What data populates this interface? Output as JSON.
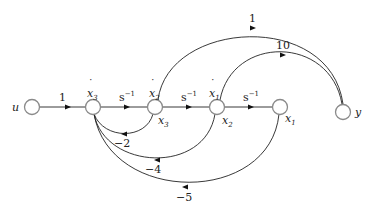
{
  "diagram": {
    "type": "signal-flow-graph",
    "nodes": [
      {
        "id": "u",
        "label": "u"
      },
      {
        "id": "x3dot",
        "label": "ẋ₃",
        "sub_label": "ẋ",
        "index": "3"
      },
      {
        "id": "x2dot",
        "label": "ẋ₂",
        "sub_label": "ẋ",
        "index": "2",
        "state_label": "x",
        "state_index": "3"
      },
      {
        "id": "x1dot",
        "label": "ẋ₁",
        "sub_label": "ẋ",
        "index": "1",
        "state_label": "x",
        "state_index": "2"
      },
      {
        "id": "x1",
        "label": "x₁",
        "state_label": "x",
        "state_index": "1"
      },
      {
        "id": "y",
        "label": "y"
      }
    ],
    "edges": [
      {
        "from": "u",
        "to": "x3dot",
        "gain": "1"
      },
      {
        "from": "x3dot",
        "to": "x2dot",
        "gain": "s",
        "gain_exp": "−1"
      },
      {
        "from": "x2dot",
        "to": "x1dot",
        "gain": "s",
        "gain_exp": "−1"
      },
      {
        "from": "x1dot",
        "to": "x1",
        "gain": "s",
        "gain_exp": "−1"
      },
      {
        "from": "x2dot",
        "to": "y",
        "gain": "1"
      },
      {
        "from": "x1dot",
        "to": "y",
        "gain": "10"
      },
      {
        "from": "x2dot",
        "to": "x3dot",
        "gain": "−2"
      },
      {
        "from": "x1dot",
        "to": "x3dot",
        "gain": "−4"
      },
      {
        "from": "x1",
        "to": "x3dot",
        "gain": "−5"
      }
    ]
  },
  "labels": {
    "u": "u",
    "y": "y",
    "x": "x",
    "dot": "˙",
    "idx1": "1",
    "idx2": "2",
    "idx3": "3",
    "s": "s",
    "neg1": "−1",
    "gain_u_x3": "1",
    "gain_top": "1",
    "gain_ten": "10",
    "fb_m2": "−2",
    "fb_m4": "−4",
    "fb_m5": "−5"
  }
}
